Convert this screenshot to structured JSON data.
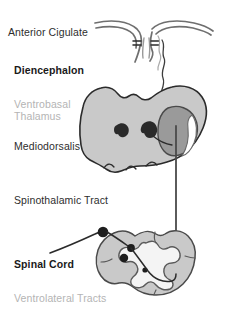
{
  "figure": {
    "width": 227,
    "height": 315,
    "background": "#ffffff"
  },
  "labels": {
    "anterior_cingulate": "Anterior Cigulate",
    "diencephalon": "Diencephalon",
    "ventrobasal_thalamus_line1": "Ventrobasal",
    "ventrobasal_thalamus_line2": "Thalamus",
    "mediodorsalis": "Mediodorsalis",
    "spinothalamic_tract": "Spinothalamic Tract",
    "spinal_cord": "Spinal Cord",
    "ventrolateral_tracts": "Ventrolateral Tracts"
  },
  "colors": {
    "text_dark": "#2e2e2e",
    "text_bold": "#1a1a1a",
    "text_gray": "#b4b4b4",
    "thalamus_fill": "#c9c9c9",
    "thalamus_stroke": "#2b2b2b",
    "nucleus_dark_fill": "#9a9a9a",
    "nucleus_spot_fill": "#2a2a2a",
    "nucleus_highlight": "#ffffff",
    "cortex_stroke": "#6f6f6f",
    "tract_line": "#3d3d3d",
    "cord_white_matter": "#c9c9c9",
    "cord_gray_matter": "#f4f4f4",
    "cord_stroke": "#5a5a5a",
    "ganglion_fill": "#1e1e1e"
  },
  "structures": [
    {
      "name": "anterior-cingulate-cortex",
      "kind": "cortex-outline",
      "region": "top"
    },
    {
      "name": "diencephalon-thalamus",
      "kind": "filled-shape",
      "region": "middle"
    },
    {
      "name": "mediodorsal-nucleus",
      "kind": "dark-oval",
      "region": "middle-right"
    },
    {
      "name": "ventrobasal-nucleus-spots",
      "kind": "dark-spots",
      "count": 2,
      "region": "middle-center"
    },
    {
      "name": "spinothalamic-tract",
      "kind": "vertical-line",
      "region": "middle-to-bottom"
    },
    {
      "name": "spinal-cord-cross-section",
      "kind": "cord",
      "region": "bottom"
    },
    {
      "name": "dorsal-root-ganglion",
      "kind": "filled-circle",
      "region": "bottom-left"
    },
    {
      "name": "primary-afferent-fiber",
      "kind": "curve",
      "region": "bottom-left"
    },
    {
      "name": "ventrolateral-tract-neurons",
      "kind": "dark-dots",
      "count": 3,
      "region": "bottom-center"
    }
  ]
}
